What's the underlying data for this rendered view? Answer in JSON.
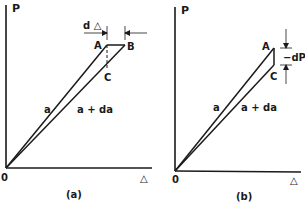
{
  "panel_a": {
    "y_axis_label": "P",
    "x_axis_label": "△",
    "origin_label": "0",
    "caption": "(a)",
    "point_a": "A",
    "point_b": "B",
    "point_c": "C",
    "increment_label": "d △",
    "line_a_label": "a",
    "line_ada_label": "a + da"
  },
  "panel_b": {
    "y_axis_label": "P",
    "x_axis_label": "△",
    "origin_label": "0",
    "caption": "(b)",
    "point_a": "A",
    "point_c": "C",
    "increment_label": "−dP",
    "line_a_label": "a",
    "line_ada_label": "a + da"
  },
  "colors": {
    "ink": "#1a1a1a",
    "background": "#ffffff"
  }
}
